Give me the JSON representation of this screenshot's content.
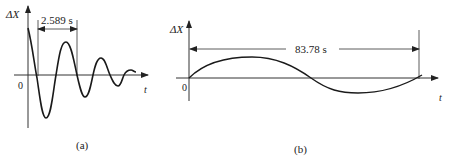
{
  "panel_a": {
    "y_axis_label": "ΔX",
    "x_axis_label": "t",
    "origin_label": "0",
    "period_annotation": "2.589 s",
    "caption": "(a)",
    "curve_description": "damped oscillation"
  },
  "panel_b": {
    "y_axis_label": "ΔX",
    "x_axis_label": "t",
    "origin_label": "0",
    "period_annotation": "83.78 s",
    "caption": "(b)",
    "curve_description": "slow sinusoidal oscillation, one period"
  },
  "colors": {
    "line": "#1a1a1a",
    "axis": "#333333",
    "background": "#ffffff"
  }
}
